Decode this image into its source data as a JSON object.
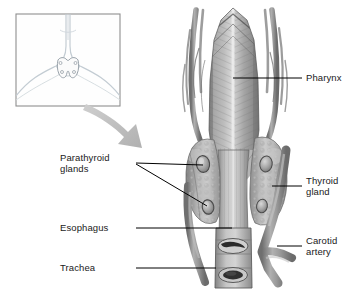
{
  "figure": {
    "inset_caption": "",
    "palette": {
      "background": "#ffffff",
      "muscle_mid": "#9a9a9a",
      "muscle_dark": "#5f5f5f",
      "muscle_light": "#d2d2d2",
      "gland": "#b4b4b4",
      "vessel": "#8e8e8e",
      "lumen_dark": "#2b2b2b",
      "inset_line": "#b9c3cb",
      "inset_border": "#8a8a8a",
      "arrow": "#bdbdbd",
      "leader_line": "#000000",
      "label_text": "#1a1a1a"
    }
  },
  "labels": {
    "pharynx": "Pharynx",
    "thyroid_gland": "Thyroid\ngland",
    "carotid_artery": "Carotid\nartery",
    "parathyroid_glands": "Parathyroid\nglands",
    "esophagus": "Esophagus",
    "trachea": "Trachea"
  },
  "structures": [
    {
      "name": "pharynx",
      "label": "Pharynx",
      "side": "right"
    },
    {
      "name": "thyroid-gland",
      "label": "Thyroid gland",
      "side": "right"
    },
    {
      "name": "carotid-artery",
      "label": "Carotid artery",
      "side": "right"
    },
    {
      "name": "parathyroid-glands",
      "label": "Parathyroid glands",
      "side": "left",
      "count": 2
    },
    {
      "name": "esophagus",
      "label": "Esophagus",
      "side": "left"
    },
    {
      "name": "trachea",
      "label": "Trachea",
      "side": "left"
    }
  ]
}
